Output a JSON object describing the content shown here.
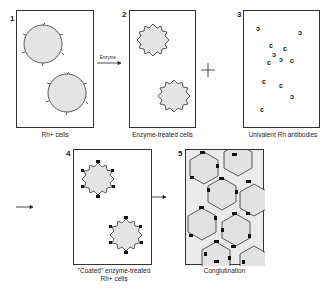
{
  "figure": {
    "panels": [
      {
        "number": "1",
        "caption": "Rh+ cells"
      },
      {
        "number": "2",
        "caption": "Enzyme-treated cells"
      },
      {
        "number": "3",
        "caption": "Univalent Rh antibodies"
      },
      {
        "number": "4",
        "caption_line1": "\"Coated\" enzyme-treated",
        "caption_line2": "Rh+ cells"
      },
      {
        "number": "5",
        "caption": "Conglutination"
      }
    ],
    "arrow_label": "Enzyme",
    "plus_symbol": "+"
  }
}
